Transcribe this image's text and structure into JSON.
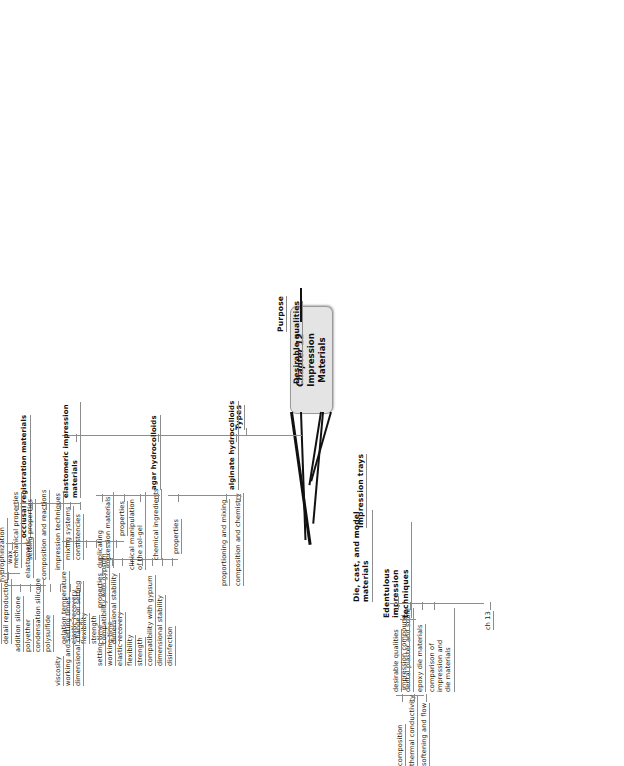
{
  "root": {
    "line1": "Chapter 12",
    "line2": "Impression Materials"
  },
  "main_branches": {
    "purpose": "Purpose",
    "desirable_qualities": "Desirable qualities",
    "types": "Types",
    "impression_trays": "Impression trays",
    "die_cast_model": "Die, cast, and model\nmaterials",
    "edentulous": "Edentulous impression\ntechniques"
  },
  "types_children": {
    "alginate": "alginate hydrocolloids",
    "agar": "agar hydrocolloids",
    "elastomeric": "elastomeric impression\nmaterials",
    "occlusal": "occlusal registration materials"
  },
  "alginate": {
    "composition": "composition and chemistry",
    "proportioning": "proportioning and mixing",
    "properties": "properties",
    "properties_children": [
      "setting time",
      "working time",
      "elastic recovery",
      "flexibility",
      "strength",
      "compatibility with gypsum",
      "dimensional stability",
      "disinfection"
    ]
  },
  "agar": {
    "chemical_ingredients": "chemical ingredients",
    "clinical": "clinical manipulation of the\nsol-gel",
    "properties": "properties",
    "duplicating": "duplicating impression\nmaterials",
    "properties_children": [
      "gelation temperature",
      "elastic recovery",
      "flexibility",
      "strength",
      "compatibility with gypsum",
      "dimensional stability"
    ],
    "duplicating_children": [
      "properties"
    ]
  },
  "elastomeric": {
    "consistencies": "consistencies",
    "mixing_systems": "mixing systems",
    "impression_techniques": "impression techniques",
    "composition_reactions": "composition and reactions",
    "setting_properties": "setting properties",
    "mechanical_properties": "mechanical properties",
    "wettability": "wettability and\nhydrophilization",
    "disinfection": "disinfection",
    "relationship": "relationship of properties and\nclinical application",
    "composition_children": [
      "addition silicone",
      "polyether",
      "condensation silicone",
      "polysulfide"
    ],
    "setting_children": [
      "viscosity",
      "working and setting times",
      "dimensional change on setting"
    ],
    "mechanical_children": [
      "elastic recovery",
      "strain in compression",
      "flow",
      "hardness",
      "tear strength",
      "creep compliance",
      "detail reproduction"
    ]
  },
  "occlusal": {
    "children": [
      "elastomeric",
      "wax"
    ]
  },
  "die_cast": {
    "ch13": "ch 13",
    "children": [
      "desirable qualities",
      "dental plaster and stone",
      "epoxy die materials",
      "comparison of impression and\ndie materials"
    ]
  },
  "edentulous": {
    "impression_compound": "impression compound",
    "children": [
      "composition",
      "thermal conductivity",
      "softening and flow"
    ]
  },
  "colors": {
    "root_fill": "#e4e4e4",
    "root_border": "#9a9a9a",
    "line": "#8d8d8d",
    "thick_branch": "#111111",
    "text": "#1a1a1a",
    "background": "#ffffff"
  }
}
